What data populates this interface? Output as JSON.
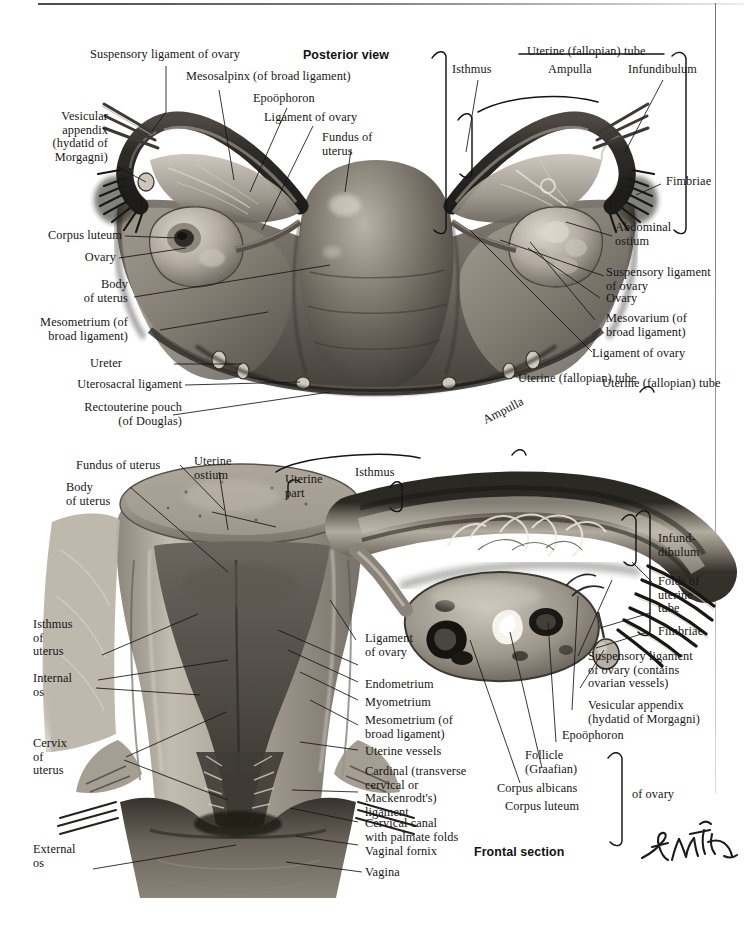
{
  "plate": {
    "signature": "F. Netter",
    "headings": [
      {
        "id": "posterior_view",
        "text": "Posterior view"
      },
      {
        "id": "frontal_section",
        "text": "Frontal section"
      }
    ]
  },
  "posterior_view": {
    "title": "Posterior view",
    "labels_left": [
      {
        "id": "suspensory-ligament-of-ovary",
        "text": "Suspensory ligament of ovary"
      },
      {
        "id": "vesicular-appendix",
        "text": "Vesicular\nappendix\n(hydatid of\nMorgagni)"
      },
      {
        "id": "corpus-luteum",
        "text": "Corpus luteum"
      },
      {
        "id": "ovary",
        "text": "Ovary"
      },
      {
        "id": "body-of-uterus",
        "text": "Body\nof uterus"
      },
      {
        "id": "mesometrium",
        "text": "Mesometrium (of\nbroad ligament)"
      },
      {
        "id": "ureter",
        "text": "Ureter"
      },
      {
        "id": "uterosacral-ligament",
        "text": "Uterosacral ligament"
      },
      {
        "id": "rectouterine-pouch",
        "text": "Rectouterine pouch\n(of Douglas)"
      }
    ],
    "labels_center": [
      {
        "id": "mesosalpinx",
        "text": "Mesosalpinx (of broad ligament)"
      },
      {
        "id": "epoophoron",
        "text": "Epoöphoron"
      },
      {
        "id": "ligament-of-ovary",
        "text": "Ligament of ovary"
      },
      {
        "id": "fundus-of-uterus",
        "text": "Fundus of\nuterus"
      }
    ],
    "labels_right": [
      {
        "id": "uterine-fallopian-tube",
        "text": "Uterine (fallopian) tube"
      },
      {
        "id": "isthmus",
        "text": "Isthmus"
      },
      {
        "id": "ampulla",
        "text": "Ampulla"
      },
      {
        "id": "infundibulum",
        "text": "Infundibulum"
      },
      {
        "id": "fimbriae",
        "text": "Fimbriae"
      },
      {
        "id": "abdominal-ostium",
        "text": "Abdominal\nostium"
      },
      {
        "id": "suspensory-ligament-of-ovary-r",
        "text": "Suspensory ligament\nof ovary"
      },
      {
        "id": "ovary-r",
        "text": "Ovary"
      },
      {
        "id": "mesovarium",
        "text": "Mesovarium (of\nbroad ligament)"
      },
      {
        "id": "ligament-of-ovary-r",
        "text": "Ligament of ovary"
      },
      {
        "id": "uterine-fallopian-tube-lower",
        "text": "Uterine (fallopian) tube"
      }
    ]
  },
  "frontal_section": {
    "title": "Frontal section",
    "labels_left": [
      {
        "id": "fundus-of-uterus-f",
        "text": "Fundus of uterus"
      },
      {
        "id": "body-of-uterus-f",
        "text": "Body\nof uterus"
      },
      {
        "id": "isthmus-of-uterus",
        "text": "Isthmus\nof\nuterus"
      },
      {
        "id": "internal-os",
        "text": "Internal\nos"
      },
      {
        "id": "cervix-of-uterus",
        "text": "Cervix\nof\nuterus"
      },
      {
        "id": "external-os",
        "text": "External\nos"
      }
    ],
    "labels_top": [
      {
        "id": "uterine-ostium",
        "text": "Uterine\nostium"
      },
      {
        "id": "uterine-part",
        "text": "Uterine\npart"
      },
      {
        "id": "isthmus-f",
        "text": "Isthmus"
      },
      {
        "id": "ampulla-f",
        "text": "Ampulla"
      },
      {
        "id": "uterine-fallopian-tube-f",
        "text": "Uterine (fallopian) tube"
      }
    ],
    "labels_mid": [
      {
        "id": "ligament-of-ovary-f",
        "text": "Ligament\nof ovary"
      },
      {
        "id": "endometrium",
        "text": "Endometrium"
      },
      {
        "id": "myometrium",
        "text": "Myometrium"
      },
      {
        "id": "mesometrium-f",
        "text": "Mesometrium (of\nbroad ligament)"
      },
      {
        "id": "uterine-vessels",
        "text": "Uterine vessels"
      },
      {
        "id": "cardinal-ligament",
        "text": "Cardinal (transverse\ncervical or\nMackenrodt's)\nligament"
      },
      {
        "id": "cervical-canal",
        "text": "Cervical canal\nwith palmate folds"
      },
      {
        "id": "vaginal-fornix",
        "text": "Vaginal fornix"
      },
      {
        "id": "vagina",
        "text": "Vagina"
      }
    ],
    "labels_right": [
      {
        "id": "infundibulum-f",
        "text": "Infund-\ndibulum"
      },
      {
        "id": "folds-of-uterine-tube",
        "text": "Folds of\nuterine\ntube"
      },
      {
        "id": "fimbriae-f",
        "text": "Fimbriae"
      },
      {
        "id": "suspensory-ligament-contains",
        "text": "Suspensory ligament\nof ovary (contains\novarian vessels)"
      },
      {
        "id": "vesicular-appendix-f",
        "text": "Vesicular appendix\n(hydatid of Morgagni)"
      },
      {
        "id": "epoophoron-f",
        "text": "Epoöphoron"
      }
    ],
    "ovary_group": {
      "items": [
        {
          "id": "follicle-graafian",
          "text": "Follicle\n(Graafian)"
        },
        {
          "id": "corpus-albicans",
          "text": "Corpus albicans"
        },
        {
          "id": "corpus-luteum-f",
          "text": "Corpus luteum"
        }
      ],
      "brace_label": "of ovary"
    }
  },
  "colors": {
    "ink": "#161616",
    "paper": "#ffffff",
    "tissue_mid": "#8e8a84",
    "tissue_dark": "#3a3833",
    "tissue_light": "#cfc9c0"
  }
}
